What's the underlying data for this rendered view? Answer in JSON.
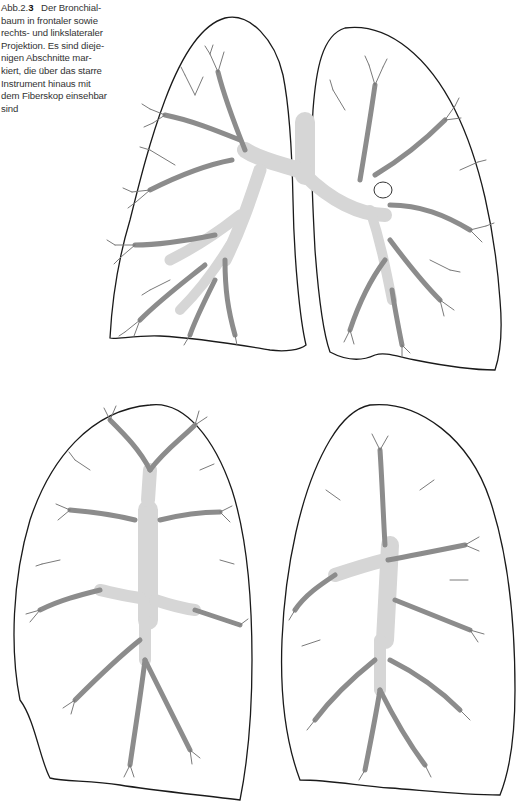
{
  "caption": {
    "figure_label": "Abb.2.",
    "figure_number": "3",
    "text": "Der Bronchialbaum in frontaler sowie rechts- und linkslateraler Projektion. Es sind diejenigen Abschnitte markiert, die über das starre Instrument hinaus mit dem Fiberskop einsehbar sind",
    "lines": [
      "Der Bronchial-",
      "baum in frontaler sowie",
      "rechts- und linkslateraler",
      "Projektion. Es sind dieje-",
      "nigen Abschnitte mar-",
      "kiert, die über das starre",
      "Instrument hinaus mit",
      "dem Fiberskop einsehbar",
      "sind"
    ]
  },
  "figure": {
    "views": [
      {
        "id": "frontal",
        "label": "frontal projection",
        "position": "top"
      },
      {
        "id": "right-lateral",
        "label": "right lateral projection",
        "position": "bottom-left"
      },
      {
        "id": "left-lateral",
        "label": "left lateral projection",
        "position": "bottom-right"
      }
    ],
    "colors": {
      "rigid_scope_visible": "#d6d6d6",
      "fiberscope_visible": "#8c8c8c",
      "outline": "#1a1a1a",
      "background": "#ffffff"
    }
  }
}
